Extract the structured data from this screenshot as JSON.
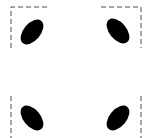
{
  "diagram": {
    "background": "#ffffff",
    "stroke_color": "#4a4a4a",
    "fill_color": "#000000",
    "corners": [
      {
        "id": "top-left",
        "ellipse": {
          "cx": 32,
          "cy": 32,
          "rx": 8.5,
          "ry": 14.5,
          "rotate": 40
        },
        "guide": "M11 48 L11 7 L48 7"
      },
      {
        "id": "top-right",
        "ellipse": {
          "cx": 118,
          "cy": 31,
          "rx": 8.5,
          "ry": 14.5,
          "rotate": -40
        },
        "guide": "M101 7 L141 7 L141 48"
      },
      {
        "id": "bottom-left",
        "ellipse": {
          "cx": 32,
          "cy": 118,
          "rx": 8.5,
          "ry": 14.5,
          "rotate": -40
        },
        "guide": "M11 96 L11 138"
      },
      {
        "id": "bottom-right",
        "ellipse": {
          "cx": 118,
          "cy": 118,
          "rx": 8.5,
          "ry": 14.5,
          "rotate": 40
        },
        "guide": "M141 96 L141 138"
      }
    ]
  }
}
